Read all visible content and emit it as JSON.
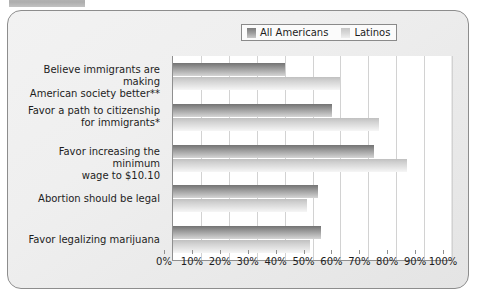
{
  "figure": {
    "caption_stub": "",
    "legend_position": "top-right"
  },
  "legend": {
    "entries": [
      {
        "label": "All Americans",
        "color": "#8f8f8f"
      },
      {
        "label": "Latinos",
        "color": "#d2d2d2"
      }
    ]
  },
  "axis": {
    "tick_labels": [
      "0%",
      "10%",
      "20%",
      "30%",
      "40%",
      "50%",
      "60%",
      "70%",
      "80%",
      "90%",
      "100%"
    ]
  },
  "chart_data": {
    "type": "bar",
    "orientation": "horizontal",
    "title": "",
    "subtitle": "",
    "xlabel": "",
    "ylabel": "",
    "xlim": [
      0,
      100
    ],
    "xticks": [
      0,
      10,
      20,
      30,
      40,
      50,
      60,
      70,
      80,
      90,
      100
    ],
    "xtick_labels": [
      "0%",
      "10%",
      "20%",
      "30%",
      "40%",
      "50%",
      "60%",
      "70%",
      "80%",
      "90%",
      "100%"
    ],
    "grid": true,
    "grid_axis": "x",
    "legend_position": "top-right",
    "categories": [
      "Believe immigrants are making American society better**",
      "Favor a path to citizenship for immigrants*",
      "Favor increasing the minimum wage to $10.10",
      "Abortion should be legal",
      "Favor legalizing marijuana"
    ],
    "category_lines": [
      [
        "Believe immigrants are making",
        "American society better**"
      ],
      [
        "Favor a path to citizenship",
        "for immigrants*"
      ],
      [
        "Favor increasing the minimum",
        "wage to $10.10"
      ],
      [
        "Abortion should be legal"
      ],
      [
        "Favor legalizing marijuana"
      ]
    ],
    "series": [
      {
        "name": "All Americans",
        "color": "#8f8f8f",
        "values": [
          40,
          57,
          72,
          52,
          53
        ]
      },
      {
        "name": "Latinos",
        "color": "#d2d2d2",
        "values": [
          60,
          74,
          84,
          48,
          49
        ]
      }
    ]
  }
}
